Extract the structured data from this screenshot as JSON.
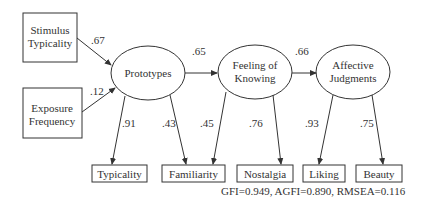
{
  "diagram": {
    "type": "structural-equation-model",
    "observed_exogenous": [
      {
        "id": "stimulus_typicality",
        "lines": [
          "Stimulus",
          "Typicality"
        ]
      },
      {
        "id": "exposure_frequency",
        "lines": [
          "Exposure",
          "Frequency"
        ]
      }
    ],
    "latent": [
      {
        "id": "prototypes",
        "lines": [
          "Prototypes"
        ]
      },
      {
        "id": "feeling_of_knowing",
        "lines": [
          "Feeling of",
          "Knowing"
        ]
      },
      {
        "id": "affective_judgments",
        "lines": [
          "Affective",
          "Judgments"
        ]
      }
    ],
    "indicators": [
      {
        "id": "typicality",
        "label": "Typicality"
      },
      {
        "id": "familiarity",
        "label": "Familiarity"
      },
      {
        "id": "nostalgia",
        "label": "Nostalgia"
      },
      {
        "id": "liking",
        "label": "Liking"
      },
      {
        "id": "beauty",
        "label": "Beauty"
      }
    ],
    "paths": [
      {
        "from": "stimulus_typicality",
        "to": "prototypes",
        "coef": ".67"
      },
      {
        "from": "exposure_frequency",
        "to": "prototypes",
        "coef": ".12"
      },
      {
        "from": "prototypes",
        "to": "feeling_of_knowing",
        "coef": ".65"
      },
      {
        "from": "feeling_of_knowing",
        "to": "affective_judgments",
        "coef": ".66"
      },
      {
        "from": "prototypes",
        "to": "typicality",
        "coef": ".91"
      },
      {
        "from": "prototypes",
        "to": "familiarity",
        "coef": ".43"
      },
      {
        "from": "feeling_of_knowing",
        "to": "familiarity",
        "coef": ".45"
      },
      {
        "from": "feeling_of_knowing",
        "to": "nostalgia",
        "coef": ".76"
      },
      {
        "from": "affective_judgments",
        "to": "liking",
        "coef": ".93"
      },
      {
        "from": "affective_judgments",
        "to": "beauty",
        "coef": ".75"
      }
    ],
    "fit_stats": "GFI=0.949, AGFI=0.890, RMSEA=0.116",
    "colors": {
      "stroke": "#333333",
      "text": "#333333",
      "background": "#ffffff"
    }
  }
}
